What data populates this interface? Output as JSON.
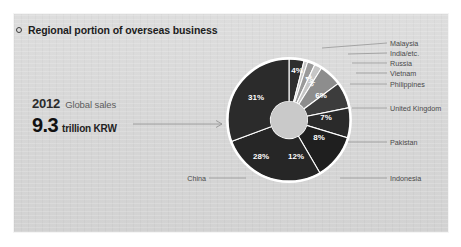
{
  "card": {
    "background": "#d9d9d9"
  },
  "header": {
    "bullet_icon": "circle-outline-icon",
    "title": "Regional portion of overseas business"
  },
  "kpi": {
    "year": "2012",
    "caption": "Global sales",
    "value": "9.3",
    "unit": "trillion KRW"
  },
  "chart_data": {
    "type": "pie",
    "title": "Regional portion of overseas business",
    "subtype": "donut",
    "units": "percent",
    "legend_position": "right-and-left-callouts",
    "categories": [
      "Malaysia",
      "India/etc.",
      "Russia",
      "Vietnam",
      "Philippines",
      "United Kingdom",
      "Pakistan",
      "Indonesia",
      "China",
      "Other"
    ],
    "values": [
      4,
      1,
      2,
      2,
      6,
      7,
      8,
      12,
      28,
      31
    ],
    "labels": [
      "4%",
      "",
      "2%",
      "",
      "6%",
      "7%",
      "8%",
      "12%",
      "28%",
      "31%"
    ],
    "colors": [
      "#2e2e2e",
      "#c6c6c6",
      "#9a9a9a",
      "#c6c6c6",
      "#8d8d8d",
      "#3c3c3c",
      "#2a2a2a",
      "#1f1f1f",
      "#262626",
      "#2b2b2b"
    ],
    "label_colors": [
      "#ffffff",
      "#ffffff",
      "#ffffff",
      "#ffffff",
      "#ffffff",
      "#ffffff",
      "#ffffff",
      "#ffffff",
      "#ffffff",
      "#ffffff"
    ],
    "callouts_right": [
      "Malaysia",
      "India/etc.",
      "Russia",
      "Vietnam",
      "Philippines",
      "United Kingdom",
      "Pakistan",
      "Indonesia"
    ],
    "callouts_left": [
      "China"
    ],
    "ring_outer_color": "#ffffff",
    "hole_color": "#c9c9c9"
  },
  "callouts": {
    "malaysia": "Malaysia",
    "india": "India/etc.",
    "russia": "Russia",
    "vietnam": "Vietnam",
    "philippines": "Philippines",
    "uk": "United Kingdom",
    "pakistan": "Pakistan",
    "indonesia": "Indonesia",
    "china": "China"
  },
  "slice_labels": {
    "s31": "31%",
    "s4": "4%",
    "s2": "2%",
    "s6": "6%",
    "s7": "7%",
    "s8": "8%",
    "s12": "12%",
    "s28": "28%"
  }
}
